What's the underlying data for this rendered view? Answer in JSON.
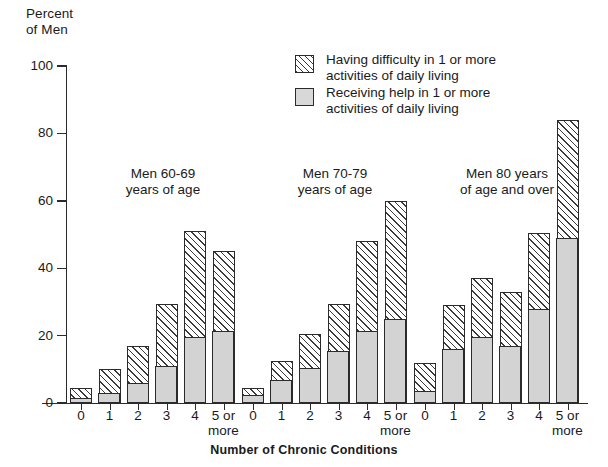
{
  "chart_data": {
    "type": "bar",
    "title": "",
    "xlabel": "Number of Chronic Conditions",
    "ylabel": "Percent\nof Men",
    "ylim": [
      0,
      100
    ],
    "yticks": [
      0,
      20,
      40,
      60,
      80,
      100
    ],
    "grid": false,
    "stacked": true,
    "legend_position": "top-center",
    "categories": [
      "0",
      "1",
      "2",
      "3",
      "4",
      "5 or\nmore"
    ],
    "groups": [
      {
        "label": "Men 60-69\nyears of age",
        "categories": [
          "0",
          "1",
          "2",
          "3",
          "4",
          "5 or\nmore"
        ],
        "difficulty_total": [
          4.5,
          10,
          17,
          29.5,
          51,
          45
        ],
        "receiving_help": [
          1.5,
          3,
          6,
          11,
          19.5,
          21.5
        ]
      },
      {
        "label": "Men 70-79\nyears of age",
        "categories": [
          "0",
          "1",
          "2",
          "3",
          "4",
          "5 or\nmore"
        ],
        "difficulty_total": [
          4.5,
          12.5,
          20.5,
          29.5,
          48,
          60
        ],
        "receiving_help": [
          2.5,
          7,
          10.5,
          15.5,
          21.5,
          25
        ]
      },
      {
        "label": "Men 80 years\nof age and over",
        "categories": [
          "0",
          "1",
          "2",
          "3",
          "4",
          "5 or\nmore"
        ],
        "difficulty_total": [
          12,
          29,
          37,
          33,
          50.5,
          84
        ],
        "receiving_help": [
          3.5,
          16,
          19.5,
          17,
          28,
          49
        ]
      }
    ],
    "series": [
      {
        "name": "Having difficulty in 1 or more\nactivities of daily living",
        "pattern": "diagonal-hatch",
        "color": "#ffffff"
      },
      {
        "name": "Receiving help in 1 or more\nactivities of daily living",
        "pattern": "solid",
        "color": "#d3d3d3"
      }
    ]
  },
  "legend": {
    "items": [
      {
        "label": "Having difficulty in 1 or more\nactivities of daily living",
        "swatch": "hatched-square-icon"
      },
      {
        "label": "Receiving help in 1 or more\nactivities of daily living",
        "swatch": "gray-square-icon"
      }
    ]
  }
}
